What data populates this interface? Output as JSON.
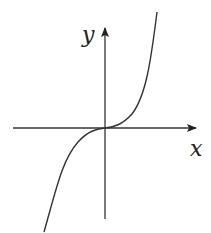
{
  "figure": {
    "type": "function-graph",
    "function": "y = x^3",
    "axes": {
      "x_label": "x",
      "y_label": "y"
    },
    "colors": {
      "axis": "#333333",
      "curve": "#333333",
      "background": "#ffffff"
    }
  }
}
